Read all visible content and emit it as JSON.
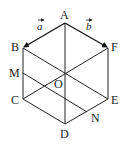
{
  "figure": {
    "type": "regular-hexagon",
    "vertices": {
      "A": {
        "x": 65,
        "y": 23
      },
      "B": {
        "x": 23,
        "y": 48
      },
      "C": {
        "x": 23,
        "y": 99
      },
      "D": {
        "x": 65,
        "y": 124
      },
      "E": {
        "x": 108,
        "y": 99
      },
      "F": {
        "x": 108,
        "y": 48
      },
      "O": {
        "x": 65,
        "y": 73
      },
      "M": {
        "x": 23,
        "y": 73
      },
      "N": {
        "x": 87,
        "y": 112
      }
    },
    "labels": {
      "A": "A",
      "B": "B",
      "C": "C",
      "D": "D",
      "E": "E",
      "F": "F",
      "O": "O",
      "M": "M",
      "N": "N"
    },
    "vectors": {
      "a": {
        "label": "a",
        "from": "A",
        "to": "B"
      },
      "b": {
        "label": "b",
        "from": "A",
        "to": "F"
      }
    },
    "segments": [
      [
        "B",
        "C"
      ],
      [
        "C",
        "D"
      ],
      [
        "D",
        "E"
      ],
      [
        "E",
        "F"
      ],
      [
        "A",
        "D"
      ],
      [
        "B",
        "E"
      ],
      [
        "C",
        "F"
      ],
      [
        "M",
        "N"
      ]
    ]
  }
}
